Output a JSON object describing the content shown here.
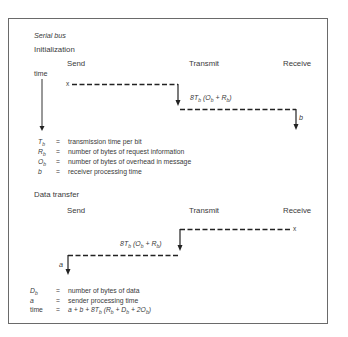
{
  "diagram": {
    "title": "Serial bus",
    "sections": [
      {
        "name": "Initialization",
        "columns": [
          "Send",
          "Transmit",
          "Receive"
        ],
        "time_label": "time",
        "arrow_label_transmit": "8T_b (O_b + R_b)",
        "arrow_label_receive": "b",
        "start_marker": "x",
        "legend": [
          {
            "symbol": "T_b",
            "eq": "=",
            "desc": "transmission time per bit"
          },
          {
            "symbol": "R_b",
            "eq": "=",
            "desc": "number of bytes of request information"
          },
          {
            "symbol": "O_b",
            "eq": "=",
            "desc": "number of bytes of overhead in message"
          },
          {
            "symbol": "b",
            "eq": "=",
            "desc": "receiver processing time"
          }
        ]
      },
      {
        "name": "Data transfer",
        "columns": [
          "Send",
          "Transmit",
          "Receive"
        ],
        "arrow_label_transmit": "8T_b (O_b + R_b)",
        "arrow_label_send": "a",
        "start_marker": "x",
        "legend": [
          {
            "symbol": "D_b",
            "eq": "=",
            "desc": "number of bytes of data"
          },
          {
            "symbol": "a",
            "eq": "=",
            "desc": "sender processing time"
          },
          {
            "symbol": "time",
            "eq": "=",
            "desc": "a + b + 8T_b (R_b + D_b + 2O_b)"
          }
        ]
      }
    ],
    "colors": {
      "line": "#2a2a2a",
      "text": "#3a3a3a",
      "frame": "#6a6a6a",
      "background": "#ffffff"
    }
  }
}
